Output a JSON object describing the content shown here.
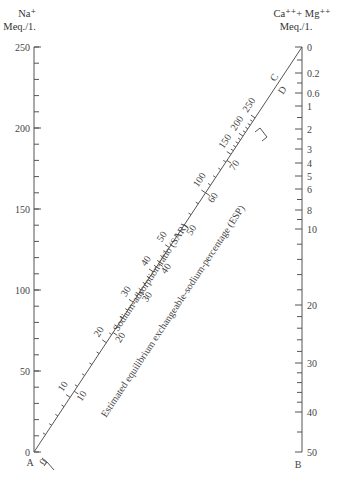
{
  "left_axis": {
    "title_line1": "Na⁺",
    "title_line2": "Meq./1.",
    "letter": "A",
    "ticks": [
      {
        "label": "250",
        "value": 250
      },
      {
        "label": "200",
        "value": 200
      },
      {
        "label": "150",
        "value": 150
      },
      {
        "label": "100",
        "value": 100
      },
      {
        "label": "50",
        "value": 50
      },
      {
        "label": "0",
        "value": 0
      }
    ],
    "minor_step": 10,
    "range": [
      0,
      250
    ]
  },
  "right_axis": {
    "title_line1": "Ca⁺⁺+ Mg⁺⁺",
    "title_line2": "Meq./1.",
    "letter": "B",
    "ticks": [
      {
        "label": "0",
        "y": 47
      },
      {
        "label": "0.2",
        "y": 73
      },
      {
        "label": "0.6",
        "y": 93
      },
      {
        "label": "1",
        "y": 106
      },
      {
        "label": "2",
        "y": 129
      },
      {
        "label": "3",
        "y": 149
      },
      {
        "label": "4",
        "y": 163
      },
      {
        "label": "5",
        "y": 176
      },
      {
        "label": "6",
        "y": 189
      },
      {
        "label": "8",
        "y": 210
      },
      {
        "label": "10",
        "y": 229
      },
      {
        "label": "20",
        "y": 305
      },
      {
        "label": "30",
        "y": 363
      },
      {
        "label": "40",
        "y": 412
      },
      {
        "label": "50",
        "y": 452
      }
    ]
  },
  "diagonal": {
    "letter_c": "C",
    "letter_d": "D",
    "sar_title": "Sodium-adsorption-ratio (SAR)",
    "esp_title": "Estimated equilibrium exchangeable-sodium-percentage (ESP)",
    "sar_ticks": [
      {
        "label": "10",
        "t": 0.135
      },
      {
        "label": "20",
        "t": 0.27
      },
      {
        "label": "30",
        "t": 0.37
      },
      {
        "label": "40",
        "t": 0.445
      },
      {
        "label": "50",
        "t": 0.505
      },
      {
        "label": "100",
        "t": 0.64
      },
      {
        "label": "150",
        "t": 0.735
      },
      {
        "label": "200",
        "t": 0.78
      },
      {
        "label": "250",
        "t": 0.825
      }
    ],
    "esp_ticks": [
      {
        "label": "0",
        "t": 0.0
      },
      {
        "label": "10",
        "t": 0.15
      },
      {
        "label": "20",
        "t": 0.295
      },
      {
        "label": "30",
        "t": 0.395
      },
      {
        "label": "40",
        "t": 0.465
      },
      {
        "label": "50",
        "t": 0.56
      },
      {
        "label": "60",
        "t": 0.64
      },
      {
        "label": "70",
        "t": 0.72
      }
    ]
  }
}
